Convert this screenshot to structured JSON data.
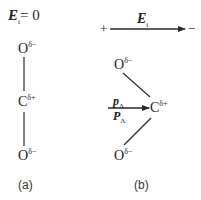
{
  "panel_a": {
    "field_label": {
      "symbol": "E",
      "subscript": "i",
      "equals": "= 0"
    },
    "atoms": [
      {
        "element": "O",
        "charge": "δ−"
      },
      {
        "element": "C",
        "charge": "δ+"
      },
      {
        "element": "O",
        "charge": "δ−"
      }
    ],
    "caption": "(a)"
  },
  "panel_b": {
    "field_arrow": {
      "plus": "+",
      "minus": "−",
      "symbol": "E",
      "subscript": "i"
    },
    "atoms": [
      {
        "element": "O",
        "charge": "δ−"
      },
      {
        "element": "C",
        "charge": "δ+"
      },
      {
        "element": "O",
        "charge": "δ−"
      }
    ],
    "dipole_labels": [
      {
        "symbol": "p",
        "subscript": "Λ"
      },
      {
        "symbol": "P",
        "subscript": "Λ"
      }
    ],
    "caption": "(b)"
  },
  "colors": {
    "line": "#2a2a2a",
    "text": "#222222",
    "background": "#ffffff"
  }
}
